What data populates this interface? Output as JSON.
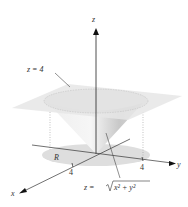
{
  "figure": {
    "type": "3d-surface-diagram",
    "axes": {
      "x_label": "x",
      "y_label": "y",
      "z_label": "z"
    },
    "ticks": {
      "x_tick": "4",
      "y_tick": "4"
    },
    "labels": {
      "plane": "z = 4",
      "cone_prefix": "z = ",
      "cone_radicand": "x² + y²",
      "region": "R"
    },
    "colors": {
      "plane": "#e4e4e4",
      "cone_light": "#f2f2f2",
      "cone_dark": "#bdbdbd",
      "region": "#dcdcdc",
      "axis": "#222222"
    }
  }
}
